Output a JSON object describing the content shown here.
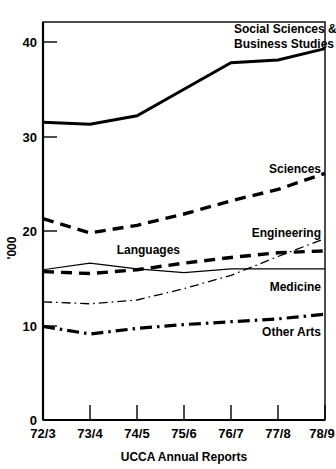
{
  "chart_data": {
    "type": "line",
    "title": "",
    "xlabel": "UCCA Annual Reports",
    "ylabel": "'000",
    "categories": [
      "72/3",
      "73/4",
      "74/5",
      "75/6",
      "76/7",
      "77/8",
      "78/9"
    ],
    "ylim": [
      0,
      43
    ],
    "yticks": [
      0,
      10,
      20,
      30,
      40
    ],
    "ytick_labels": [
      "0",
      "10",
      "20",
      "30",
      "40"
    ],
    "grid": false,
    "legend": "inline-labels",
    "series": [
      {
        "name": "Social Sciences & Business Studies",
        "label_lines": [
          "Social Sciences &",
          "Business Studies"
        ],
        "style": "solid-thick",
        "values": [
          31.5,
          31.3,
          32.2,
          35.0,
          37.8,
          38.1,
          39.3
        ]
      },
      {
        "name": "Sciences",
        "label_lines": [
          "Sciences"
        ],
        "style": "dashed-thick",
        "values": [
          21.3,
          19.8,
          20.6,
          21.8,
          23.2,
          24.4,
          26.1
        ]
      },
      {
        "name": "Engineering",
        "label_lines": [
          "Engineering"
        ],
        "style": "dashdot-thin",
        "values": [
          12.5,
          12.3,
          12.7,
          13.9,
          15.3,
          17.3,
          19.2
        ]
      },
      {
        "name": "Languages",
        "label_lines": [
          "Languages"
        ],
        "style": "dashed-thick",
        "values": [
          15.7,
          15.5,
          15.9,
          16.6,
          17.2,
          17.7,
          17.9
        ]
      },
      {
        "name": "Medicine",
        "label_lines": [
          "Medicine"
        ],
        "style": "solid-thin",
        "values": [
          15.9,
          16.6,
          16.0,
          15.6,
          16.0,
          16.0,
          16.0
        ]
      },
      {
        "name": "Other Arts",
        "label_lines": [
          "Other Arts"
        ],
        "style": "dashdot-thick",
        "values": [
          9.9,
          9.1,
          9.7,
          10.1,
          10.4,
          10.7,
          11.2
        ]
      }
    ]
  },
  "axis": {
    "y_title": "'000",
    "x_title": "UCCA Annual Reports"
  }
}
